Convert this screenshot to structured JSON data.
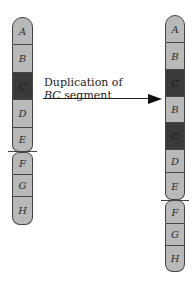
{
  "colors": {
    "light_segment": "#b9b9b9",
    "dark_segment": "#3a3a3a",
    "outline": "#444444",
    "background": "#ffffff"
  },
  "left_chromosome": {
    "name": "original",
    "segments": [
      {
        "label": "A",
        "shade": "light"
      },
      {
        "label": "B",
        "shade": "light"
      },
      {
        "label": "C",
        "shade": "dark"
      },
      {
        "label": "D",
        "shade": "light"
      },
      {
        "label": "E",
        "shade": "light"
      },
      {
        "label": "F",
        "shade": "light"
      },
      {
        "label": "G",
        "shade": "light"
      },
      {
        "label": "H",
        "shade": "light"
      }
    ],
    "centromere_between": [
      "E",
      "F"
    ]
  },
  "right_chromosome": {
    "name": "duplicated",
    "segments": [
      {
        "label": "A",
        "shade": "light"
      },
      {
        "label": "B",
        "shade": "light"
      },
      {
        "label": "C",
        "shade": "dark"
      },
      {
        "label": "B",
        "shade": "light"
      },
      {
        "label": "C",
        "shade": "dark"
      },
      {
        "label": "D",
        "shade": "light"
      },
      {
        "label": "E",
        "shade": "light"
      },
      {
        "label": "F",
        "shade": "light"
      },
      {
        "label": "G",
        "shade": "light"
      },
      {
        "label": "H",
        "shade": "light"
      }
    ],
    "centromere_between": [
      "E",
      "F"
    ]
  },
  "arrow": {
    "line1": "Duplication of",
    "line2_italic": "BC",
    "line2_rest": " segment"
  }
}
